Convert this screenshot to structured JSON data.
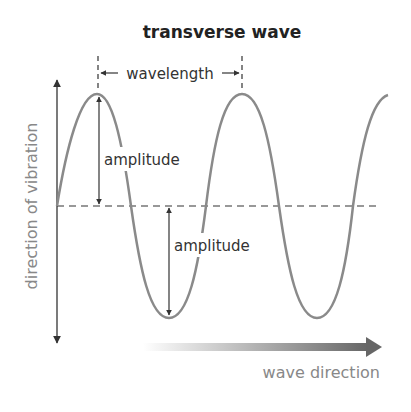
{
  "title": "transverse wave",
  "labels": {
    "wavelength": "wavelength",
    "amplitude_upper": "amplitude",
    "amplitude_lower": "amplitude",
    "vertical_axis": "direction of vibration",
    "wave_direction": "wave direction"
  },
  "colors": {
    "wave": "#8a8a8a",
    "axis": "#333333",
    "text_dark": "#222222",
    "text_grey": "#888888"
  }
}
